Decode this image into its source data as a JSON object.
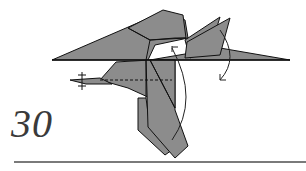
{
  "diagram": {
    "step_number": "30",
    "colors": {
      "paper": "#8c8c8c",
      "line": "#111111",
      "arrow": "#222222",
      "rule": "#7a7a7a",
      "number": "#3a3a3a"
    },
    "symbols": [
      {
        "type": "valley-fold-line",
        "style": "dashed"
      },
      {
        "type": "rotate-arrow",
        "direction": "up",
        "location": "center"
      },
      {
        "type": "rotate-arrow",
        "direction": "down",
        "location": "right"
      },
      {
        "type": "pinch-marks",
        "location": "left-tip"
      }
    ]
  }
}
